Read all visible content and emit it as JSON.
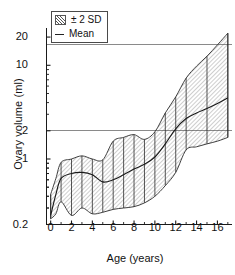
{
  "chart_data": {
    "type": "line",
    "title": "",
    "xlabel": "Age (years)",
    "ylabel": "Ovary volume (ml)",
    "yscale": "log",
    "ylim": [
      0.2,
      25
    ],
    "xlim": [
      -0.4,
      17.4
    ],
    "grid": "horizontal gridlines at 2 and 20",
    "legend_position": "top-left inside plot",
    "yticks": [
      "0.2",
      "1",
      "2",
      "10",
      "20"
    ],
    "ytick_values": [
      0.2,
      1,
      2,
      10,
      20
    ],
    "xticks": [
      "0",
      "2",
      "4",
      "6",
      "8",
      "10",
      "12",
      "14",
      "16"
    ],
    "xtick_values": [
      0,
      2,
      4,
      6,
      8,
      10,
      12,
      14,
      16
    ],
    "x": [
      0,
      0.5,
      1,
      2,
      3,
      4,
      5,
      6,
      7,
      8,
      9,
      10,
      11,
      12,
      13,
      14,
      15,
      16,
      17
    ],
    "series": [
      {
        "name": "Mean",
        "values": [
          0.25,
          0.42,
          0.62,
          0.7,
          0.72,
          0.68,
          0.57,
          0.6,
          0.68,
          0.78,
          0.88,
          1.05,
          1.45,
          2.1,
          2.7,
          3.1,
          3.45,
          3.9,
          4.5
        ]
      },
      {
        "name": "+2 SD",
        "values": [
          0.42,
          0.62,
          0.92,
          1.0,
          1.08,
          1.0,
          0.98,
          1.55,
          1.7,
          1.82,
          1.62,
          1.95,
          3.1,
          4.6,
          7.3,
          9.8,
          12.5,
          16.5,
          22.0
        ]
      },
      {
        "name": "-2 SD",
        "values": [
          0.23,
          0.26,
          0.35,
          0.25,
          0.3,
          0.26,
          0.27,
          0.29,
          0.3,
          0.31,
          0.34,
          0.4,
          0.52,
          0.72,
          1.25,
          1.35,
          1.45,
          1.55,
          1.7
        ]
      }
    ],
    "band": {
      "name": "± 2 SD",
      "upper_series": "+2 SD",
      "lower_series": "-2 SD"
    },
    "error_bar_ages": [
      0,
      1,
      2,
      3,
      4,
      5,
      6,
      7,
      8,
      9,
      10,
      11,
      12,
      13,
      15,
      17
    ]
  },
  "legend": {
    "items": [
      {
        "label": "± 2 SD",
        "marker": "hatched-swatch"
      },
      {
        "label": "Mean",
        "marker": "line"
      }
    ]
  },
  "axes": {
    "x_title": "Age (years)",
    "y_title": "Ovary volume (ml)"
  },
  "colors": {
    "axis": "#1a1a1a",
    "grid": "#808080",
    "band_hatch": "#555555",
    "mean_line": "#1a1a1a",
    "background": "#ffffff"
  }
}
